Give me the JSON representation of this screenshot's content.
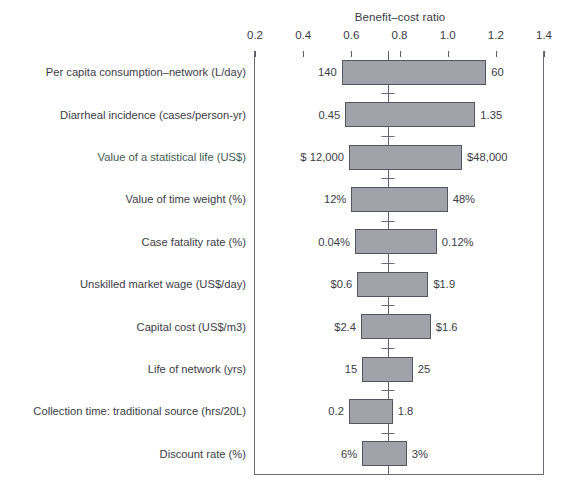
{
  "chart_data": {
    "type": "bar",
    "subtype": "tornado",
    "title": "Benefit–cost ratio",
    "xlabel": "Benefit–cost ratio",
    "ylabel": "",
    "xlim": [
      0.2,
      1.4
    ],
    "xticks": [
      "0.2",
      "0.4",
      "0.6",
      "0.8",
      "1.0",
      "1.2",
      "1.4"
    ],
    "xtick_values": [
      0.2,
      0.4,
      0.6,
      0.8,
      1.0,
      1.2,
      1.4
    ],
    "baseline": 0.752,
    "grid": false,
    "legend": "none",
    "bar_fill": "#a2a2aa",
    "bar_edge": "#55555f",
    "categories": [
      "Per capita consumption–network (L/day)",
      "Diarrheal incidence (cases/person-yr)",
      "Value of a statistical life (US$)",
      "Value of time weight (%)",
      "Case fatality rate (%)",
      "Unskilled market wage (US$/day)",
      "Capital cost (US$/m3)",
      "Life of network (yrs)",
      "Collection time: traditional source (hrs/20L)",
      "Discount rate (%)"
    ],
    "bars": [
      {
        "label": "Per capita consumption–network (L/day)",
        "low_ratio": 0.56,
        "high_ratio": 1.16,
        "low_text": "140",
        "high_text": "60",
        "label_tinted": false
      },
      {
        "label": "Diarrheal incidence (cases/person-yr)",
        "low_ratio": 0.575,
        "high_ratio": 1.115,
        "low_text": "0.45",
        "high_text": "1.35",
        "label_tinted": false
      },
      {
        "label": "Value of a statistical life (US$)",
        "low_ratio": 0.59,
        "high_ratio": 1.06,
        "low_text": "$ 12,000",
        "high_text": "$48,000",
        "label_tinted": true
      },
      {
        "label": "Value of time weight (%)",
        "low_ratio": 0.6,
        "high_ratio": 1.0,
        "low_text": "12%",
        "high_text": "48%",
        "label_tinted": false
      },
      {
        "label": "Case fatality rate (%)",
        "low_ratio": 0.615,
        "high_ratio": 0.955,
        "low_text": "0.04%",
        "high_text": "0.12%",
        "label_tinted": false
      },
      {
        "label": "Unskilled market wage (US$/day)",
        "low_ratio": 0.625,
        "high_ratio": 0.92,
        "low_text": "$0.6",
        "high_text": "$1.9",
        "label_tinted": false
      },
      {
        "label": "Capital cost (US$/m3)",
        "low_ratio": 0.64,
        "high_ratio": 0.93,
        "low_text": "$2.4",
        "high_text": "$1.6",
        "label_tinted": false
      },
      {
        "label": "Life of network (yrs)",
        "low_ratio": 0.645,
        "high_ratio": 0.855,
        "low_text": "15",
        "high_text": "25",
        "label_tinted": false
      },
      {
        "label": "Collection time: traditional source (hrs/20L)",
        "low_ratio": 0.59,
        "high_ratio": 0.772,
        "low_text": "0.2",
        "high_text": "1.8",
        "label_tinted": false
      },
      {
        "label": "Discount rate (%)",
        "low_ratio": 0.645,
        "high_ratio": 0.83,
        "low_text": "6%",
        "high_text": "3%",
        "label_tinted": false
      }
    ]
  }
}
